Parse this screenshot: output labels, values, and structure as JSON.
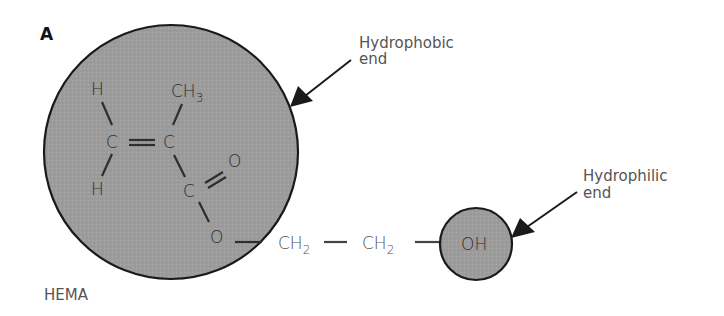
{
  "figure": {
    "panel_label": "A",
    "molecule_name": "HEMA",
    "hydrophobic_label_line1": "Hydrophobic",
    "hydrophobic_label_line2": "end",
    "hydrophilic_label_line1": "Hydrophilic",
    "hydrophilic_label_line2": "end"
  },
  "molecule": {
    "atoms": {
      "h_top": "H",
      "h_bottom": "H",
      "c_left": "C",
      "c_right": "C",
      "methyl_c": "CH",
      "methyl_sub": "3",
      "o_carbonyl": "O",
      "c_carbonyl": "C",
      "o_ester": "O",
      "ch2_1": "CH",
      "ch2_1_sub": "2",
      "ch2_2": "CH",
      "ch2_2_sub": "2",
      "oh": "OH"
    }
  },
  "colors": {
    "circle_fill": "#9c9c9c",
    "circle_stroke": "#1a1a1a",
    "text_inside": "#2e2e2e",
    "text_outside": "#555555",
    "arrow": "#1a1a1a"
  }
}
